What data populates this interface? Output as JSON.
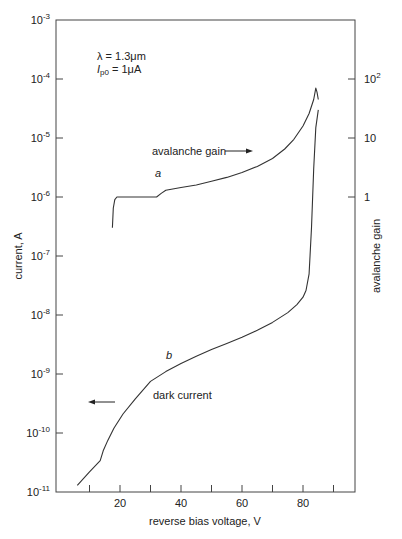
{
  "chart_data": {
    "type": "line",
    "title": "",
    "xlabel": "reverse bias voltage, V",
    "ylabel": "current, A",
    "y2label": "avalanche gain",
    "xlim": [
      0,
      97
    ],
    "ylim": [
      1e-11,
      0.001
    ],
    "yscale": "log",
    "y2lim": [
      0.01,
      1000
    ],
    "y2scale": "log",
    "grid": false,
    "x_ticks": [
      10,
      20,
      30,
      40,
      50,
      60,
      70,
      80,
      90
    ],
    "x_tick_labels": [
      {
        "v": 20,
        "label": "20"
      },
      {
        "v": 40,
        "label": "40"
      },
      {
        "v": 60,
        "label": "60"
      },
      {
        "v": 80,
        "label": "80"
      }
    ],
    "y_ticks": [
      {
        "exp": -3,
        "base": "10",
        "sup": "-3"
      },
      {
        "exp": -4,
        "base": "10",
        "sup": "-4"
      },
      {
        "exp": -5,
        "base": "10",
        "sup": "-5"
      },
      {
        "exp": -6,
        "base": "10",
        "sup": "-6"
      },
      {
        "exp": -7,
        "base": "10",
        "sup": "-7"
      },
      {
        "exp": -8,
        "base": "10",
        "sup": "-8"
      },
      {
        "exp": -9,
        "base": "10",
        "sup": "-9"
      },
      {
        "exp": -10,
        "base": "10",
        "sup": "-10"
      },
      {
        "exp": -11,
        "base": "10",
        "sup": "-11"
      }
    ],
    "y2_ticks": [
      {
        "exp": -4,
        "label": "10",
        "sup": "2"
      },
      {
        "exp": -5,
        "label": "10",
        "sup": ""
      },
      {
        "exp": -6,
        "label": "1",
        "sup": ""
      }
    ],
    "series": [
      {
        "name": "a",
        "label": "avalanche gain",
        "axis": "right (photocurrent, A on left scale)",
        "x": [
          17.5,
          17.8,
          18.3,
          19.0,
          20,
          25,
          30,
          32,
          33.5,
          35,
          40,
          45,
          50,
          55,
          60,
          65,
          70,
          74,
          77,
          80,
          82,
          83.5,
          84.2,
          84.6,
          85
        ],
        "y": [
          3e-07,
          6.5e-07,
          9e-07,
          1e-06,
          1e-06,
          1e-06,
          1e-06,
          1e-06,
          1.15e-06,
          1.3e-06,
          1.45e-06,
          1.6e-06,
          1.85e-06,
          2.15e-06,
          2.6e-06,
          3.3e-06,
          4.5e-06,
          6.5e-06,
          9.5e-06,
          1.6e-05,
          2.6e-05,
          4.5e-05,
          7e-05,
          6e-05,
          4.5e-05
        ]
      },
      {
        "name": "b",
        "label": "dark current",
        "axis": "left",
        "x": [
          6,
          10,
          13.5,
          14.5,
          16,
          18,
          21,
          25,
          30,
          35,
          40,
          45,
          50,
          55,
          60,
          65,
          70,
          75,
          78,
          80,
          81,
          82,
          82.8,
          83.5,
          84.2,
          85
        ],
        "y": [
          1.3e-11,
          2.2e-11,
          3.4e-11,
          5e-11,
          7.5e-11,
          1.2e-10,
          2.1e-10,
          3.8e-10,
          7.5e-10,
          1.1e-09,
          1.5e-09,
          2e-09,
          2.6e-09,
          3.3e-09,
          4.2e-09,
          5.5e-09,
          7.5e-09,
          1.1e-08,
          1.5e-08,
          2e-08,
          2.6e-08,
          5e-08,
          3e-07,
          3e-06,
          1.5e-05,
          3e-05
        ]
      }
    ],
    "annotations": [
      {
        "text": "λ = 1.3μm",
        "x": 20,
        "y": 0.0004
      },
      {
        "text": "I",
        "sub": "p0",
        "suffix": " = 1μA",
        "x": 20,
        "y": 0.00017
      },
      {
        "text": "avalanche gain",
        "arrow": "right",
        "x": 30,
        "y": 1.6e-05
      },
      {
        "text": "a",
        "italic": true,
        "x": 33,
        "y": 3e-06
      },
      {
        "text": "b",
        "italic": true,
        "x": 35,
        "y": 1.8e-09
      },
      {
        "text": "dark current",
        "x": 40,
        "y": 4e-10
      },
      {
        "text": "",
        "arrow": "left",
        "x": 15,
        "y": 4e-10
      }
    ]
  },
  "labels": {
    "lambda": "λ = 1.3μm",
    "ip0_main": "I",
    "ip0_sub": "p0",
    "ip0_suffix": " = 1μA",
    "avalanche_gain": "avalanche gain",
    "curve_a": "a",
    "curve_b": "b",
    "dark_current": "dark current",
    "xlabel": "reverse bias voltage, V",
    "ylabel": "current, A",
    "y2label": "avalanche gain"
  }
}
